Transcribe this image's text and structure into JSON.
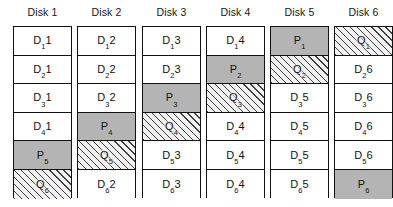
{
  "diagram": {
    "row_count": 6,
    "column_count": 6,
    "colors": {
      "background": "#ffffff",
      "border": "#121212",
      "data_fill": "#ffffff",
      "parity_fill": "#b4b4b4",
      "qparity_fill": "#f2f2f2",
      "text": "#121212"
    }
  },
  "columns": [
    {
      "header": "Disk 1",
      "cells": [
        {
          "base": "D",
          "sub": "1",
          "suffix": "1",
          "kind": "data"
        },
        {
          "base": "D",
          "sub": "2",
          "suffix": "1",
          "kind": "data"
        },
        {
          "base": "D",
          "sub": "3",
          "suffix": "1",
          "kind": "data"
        },
        {
          "base": "D",
          "sub": "4",
          "suffix": "1",
          "kind": "data"
        },
        {
          "base": "P",
          "sub": "5",
          "suffix": "",
          "kind": "parity"
        },
        {
          "base": "Q",
          "sub": "6",
          "suffix": "",
          "kind": "qparity"
        }
      ]
    },
    {
      "header": "Disk 2",
      "cells": [
        {
          "base": "D",
          "sub": "1",
          "suffix": "2",
          "kind": "data"
        },
        {
          "base": "D",
          "sub": "2",
          "suffix": "2",
          "kind": "data"
        },
        {
          "base": "D",
          "sub": "3",
          "suffix": "2",
          "kind": "data"
        },
        {
          "base": "P",
          "sub": "4",
          "suffix": "",
          "kind": "parity"
        },
        {
          "base": "Q",
          "sub": "5",
          "suffix": "",
          "kind": "qparity"
        },
        {
          "base": "D",
          "sub": "6",
          "suffix": "2",
          "kind": "data"
        }
      ]
    },
    {
      "header": "Disk 3",
      "cells": [
        {
          "base": "D",
          "sub": "1",
          "suffix": "3",
          "kind": "data"
        },
        {
          "base": "D",
          "sub": "2",
          "suffix": "3",
          "kind": "data"
        },
        {
          "base": "P",
          "sub": "3",
          "suffix": "",
          "kind": "parity"
        },
        {
          "base": "Q",
          "sub": "4",
          "suffix": "",
          "kind": "qparity"
        },
        {
          "base": "D",
          "sub": "5",
          "suffix": "3",
          "kind": "data"
        },
        {
          "base": "D",
          "sub": "6",
          "suffix": "3",
          "kind": "data"
        }
      ]
    },
    {
      "header": "Disk 4",
      "cells": [
        {
          "base": "D",
          "sub": "1",
          "suffix": "4",
          "kind": "data"
        },
        {
          "base": "P",
          "sub": "2",
          "suffix": "",
          "kind": "parity"
        },
        {
          "base": "Q",
          "sub": "3",
          "suffix": "",
          "kind": "qparity"
        },
        {
          "base": "D",
          "sub": "4",
          "suffix": "4",
          "kind": "data"
        },
        {
          "base": "D",
          "sub": "5",
          "suffix": "4",
          "kind": "data"
        },
        {
          "base": "D",
          "sub": "6",
          "suffix": "4",
          "kind": "data"
        }
      ]
    },
    {
      "header": "Disk 5",
      "cells": [
        {
          "base": "P",
          "sub": "1",
          "suffix": "",
          "kind": "parity"
        },
        {
          "base": "Q",
          "sub": "2",
          "suffix": "",
          "kind": "qparity"
        },
        {
          "base": "D",
          "sub": "3",
          "suffix": "5",
          "kind": "data"
        },
        {
          "base": "D",
          "sub": "4",
          "suffix": "5",
          "kind": "data"
        },
        {
          "base": "D",
          "sub": "5",
          "suffix": "5",
          "kind": "data"
        },
        {
          "base": "D",
          "sub": "6",
          "suffix": "5",
          "kind": "data"
        }
      ]
    },
    {
      "header": "Disk 6",
      "cells": [
        {
          "base": "Q",
          "sub": "1",
          "suffix": "",
          "kind": "qparity"
        },
        {
          "base": "D",
          "sub": "2",
          "suffix": "6",
          "kind": "data"
        },
        {
          "base": "D",
          "sub": "3",
          "suffix": "6",
          "kind": "data"
        },
        {
          "base": "D",
          "sub": "4",
          "suffix": "6",
          "kind": "data"
        },
        {
          "base": "D",
          "sub": "5",
          "suffix": "6",
          "kind": "data"
        },
        {
          "base": "P",
          "sub": "6",
          "suffix": "",
          "kind": "parity"
        }
      ]
    }
  ],
  "layout": {
    "column_left_positions": [
      13,
      77,
      142,
      206,
      270,
      334
    ]
  }
}
